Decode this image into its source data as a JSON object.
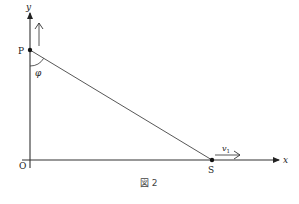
{
  "figure": {
    "caption": "図 2",
    "labels": {
      "y_axis": "y",
      "x_axis": "x",
      "origin": "O",
      "point_p": "P",
      "point_s": "S",
      "angle": "φ",
      "velocity_base": "v",
      "velocity_sub": "1"
    },
    "colors": {
      "line": "#333333",
      "background": "#ffffff"
    }
  }
}
